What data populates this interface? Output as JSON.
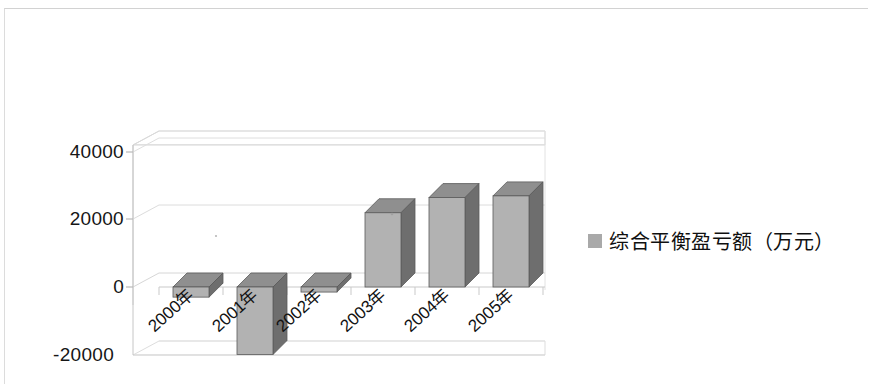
{
  "document": {
    "kind": "scanned-chart-figure",
    "background_color": "#ffffff",
    "frame_color": "#d8d8d8"
  },
  "legend": {
    "position": "right",
    "marker_icon": "square-swatch-icon",
    "marker_color": "#a9a9a9",
    "label": "综合平衡盈亏额（万元）"
  },
  "axes": {
    "y_ticks": [
      "40000",
      "20000",
      "0",
      "-20000"
    ],
    "x_ticks": [
      "2000年",
      "2001年",
      "2002年",
      "2003年",
      "2004年",
      "2005年"
    ]
  },
  "chart_data": {
    "type": "bar",
    "title": "",
    "subtitle": "",
    "xlabel": "",
    "ylabel": "",
    "style": "3d-column",
    "grid": true,
    "legend_position": "right",
    "ylim": [
      -20000,
      40000
    ],
    "ytick_values": [
      40000,
      20000,
      0,
      -20000
    ],
    "categories": [
      "2000年",
      "2001年",
      "2002年",
      "2003年",
      "2004年",
      "2005年"
    ],
    "series": [
      {
        "name": "综合平衡盈亏额（万元）",
        "color": "#b2b2b2",
        "values": [
          -3000,
          -20000,
          -1500,
          22000,
          26500,
          27000
        ]
      }
    ]
  }
}
